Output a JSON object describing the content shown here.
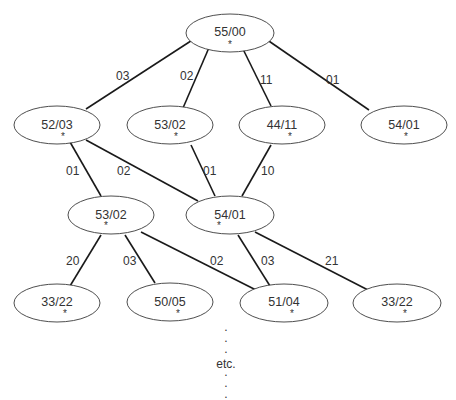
{
  "nodes": {
    "root": {
      "label": "55/00",
      "mark": "*"
    },
    "n1": {
      "label": "52/03",
      "mark": "*"
    },
    "n2": {
      "label": "53/02",
      "mark": "*"
    },
    "n3": {
      "label": "44/11",
      "mark": "*"
    },
    "n4": {
      "label": "54/01",
      "mark": "*"
    },
    "m1": {
      "label": "53/02",
      "mark": "*"
    },
    "m2": {
      "label": "54/01",
      "mark": "*"
    },
    "b1": {
      "label": "33/22",
      "mark": "*"
    },
    "b2": {
      "label": "50/05",
      "mark": "*"
    },
    "b3": {
      "label": "51/04",
      "mark": "*"
    },
    "b4": {
      "label": "33/22",
      "mark": "*"
    }
  },
  "edges": {
    "root_n1": "03",
    "root_n2": "02",
    "root_n3": "11",
    "root_n4": "01",
    "n1_m1": "01",
    "n1_m2": "02",
    "n2_m2": "01",
    "n3_m2": "10",
    "m1_b1": "20",
    "m1_b2": "03",
    "m1_b3": "02",
    "m2_b3": "03",
    "m2_b4": "21"
  },
  "continuation": {
    "label": "etc.",
    "dot": "."
  }
}
